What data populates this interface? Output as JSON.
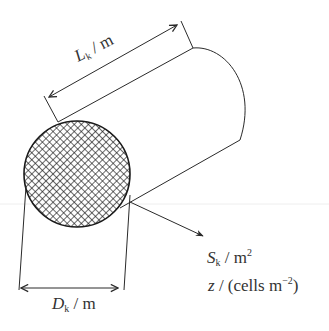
{
  "diagram": {
    "colors": {
      "stroke": "#2a2a2a",
      "hatch": "#1a1a1a",
      "text": "#333333",
      "background": "#ffffff"
    },
    "labels": {
      "length": {
        "symbol": "L",
        "subscript": "k",
        "unit": " / m"
      },
      "diameter": {
        "symbol": "D",
        "subscript": "k",
        "unit": " / m"
      },
      "area": {
        "symbol": "S",
        "subscript": "k",
        "unit": " / m",
        "superscript": "2"
      },
      "density": {
        "symbol": "z",
        "unit": " / (cells m",
        "superscript": "−2",
        "close": ")"
      }
    }
  }
}
